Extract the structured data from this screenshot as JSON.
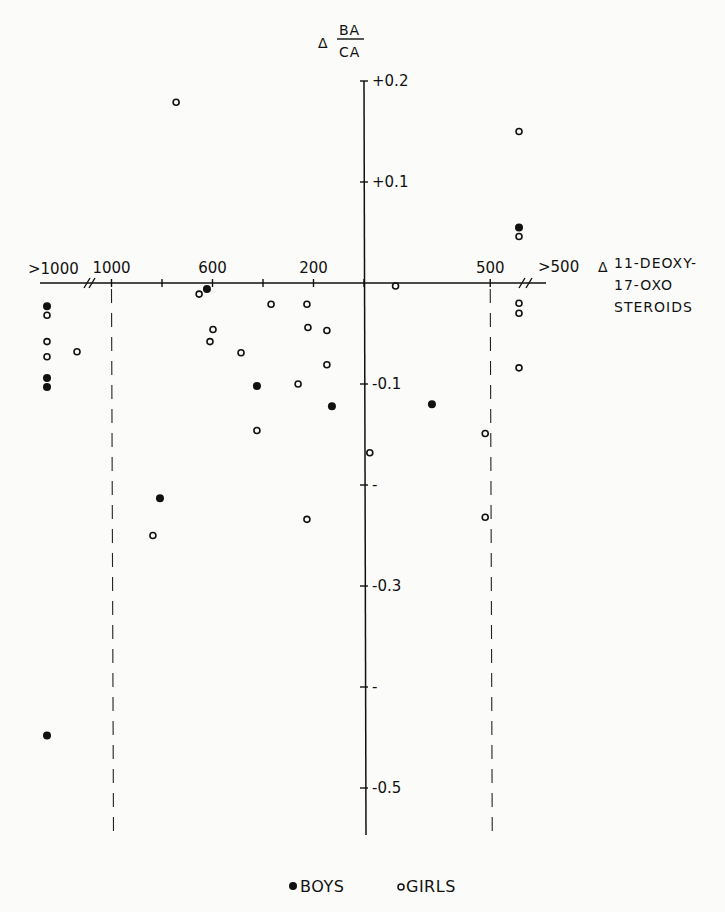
{
  "chart_data": {
    "type": "scatter",
    "title": "",
    "ylabel": {
      "delta": "Δ",
      "numerator": "BA",
      "denominator": "CA"
    },
    "xlabel": {
      "delta": "Δ",
      "lines": [
        "11-DEOXY-",
        "17-OXO",
        "STEROIDS"
      ]
    },
    "ylim": [
      -0.55,
      0.2
    ],
    "y_ticks": [
      {
        "value": 0.2,
        "label": "+0.2"
      },
      {
        "value": 0.1,
        "label": "+0.1"
      },
      {
        "value": -0.1,
        "label": "-0.1"
      },
      {
        "value": -0.2,
        "label": "-"
      },
      {
        "value": -0.3,
        "label": "-0.3"
      },
      {
        "value": -0.4,
        "label": "-"
      },
      {
        "value": -0.5,
        "label": "-0.5"
      }
    ],
    "x_axis_note": "Left of the vertical axis the x-axis counts up to the left (positive); right of it, magnitudes count to the right (stored as negative). Points beyond the axis breaks are the overflow groups.",
    "x_ticks": [
      {
        "value": 1000,
        "label": "1000",
        "dashed_line": true
      },
      {
        "value": 800,
        "label": ""
      },
      {
        "value": 600,
        "label": "600"
      },
      {
        "value": 400,
        "label": ""
      },
      {
        "value": 200,
        "label": "200"
      },
      {
        "value": 0,
        "label": ""
      },
      {
        "value": -500,
        "label": "500",
        "dashed_line": true
      }
    ],
    "x_overflow": {
      "left_label": ">1000",
      "right_label": ">500"
    },
    "legend": {
      "position": "bottom-center",
      "entries": [
        {
          "name": "BOYS",
          "marker": "filled-circle"
        },
        {
          "name": "GIRLS",
          "marker": "open-circle"
        }
      ]
    },
    "series": [
      {
        "name": "BOYS",
        "marker": "filled",
        "points": [
          {
            "x": ">1000",
            "y": -0.023
          },
          {
            "x": ">1000",
            "y": -0.094
          },
          {
            "x": ">1000",
            "y": -0.103
          },
          {
            "x": ">1000",
            "y": -0.448
          },
          {
            "x": 808,
            "y": -0.213
          },
          {
            "x": 622,
            "y": -0.006
          },
          {
            "x": 424,
            "y": -0.102
          },
          {
            "x": 127,
            "y": -0.122
          },
          {
            "x": -269,
            "y": -0.12
          },
          {
            "x": ">500",
            "y": 0.055
          }
        ]
      },
      {
        "name": "GIRLS",
        "marker": "open",
        "points": [
          {
            "x": 744,
            "y": 0.179
          },
          {
            "x": ">1000",
            "y": -0.032
          },
          {
            "x": ">1000",
            "y": -0.058
          },
          {
            "x": ">1000",
            "y": -0.073
          },
          {
            "x": ">1000",
            "y": -0.068,
            "offset": 1
          },
          {
            "x": 836,
            "y": -0.25
          },
          {
            "x": 653,
            "y": -0.011
          },
          {
            "x": 598,
            "y": -0.046
          },
          {
            "x": 610,
            "y": -0.058
          },
          {
            "x": 487,
            "y": -0.069
          },
          {
            "x": 368,
            "y": -0.021
          },
          {
            "x": 424,
            "y": -0.146
          },
          {
            "x": 226,
            "y": -0.021
          },
          {
            "x": 222,
            "y": -0.044
          },
          {
            "x": 147,
            "y": -0.047
          },
          {
            "x": 147,
            "y": -0.081
          },
          {
            "x": 261,
            "y": -0.1
          },
          {
            "x": 226,
            "y": -0.234
          },
          {
            "x": -23,
            "y": -0.168
          },
          {
            "x": -125,
            "y": -0.003
          },
          {
            "x": -480,
            "y": -0.149
          },
          {
            "x": -480,
            "y": -0.232
          },
          {
            "x": ">500",
            "y": 0.15
          },
          {
            "x": ">500",
            "y": 0.046
          },
          {
            "x": ">500",
            "y": -0.02
          },
          {
            "x": ">500",
            "y": -0.03
          },
          {
            "x": ">500",
            "y": -0.084
          }
        ]
      }
    ]
  }
}
